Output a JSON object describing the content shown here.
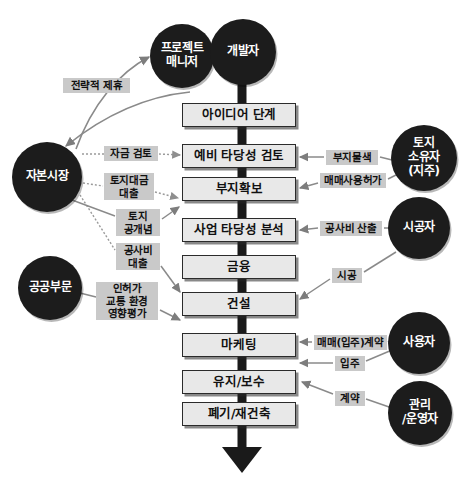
{
  "diagram": {
    "colors": {
      "box_fill": "#e8e8e8",
      "box_border": "#2b2b2b",
      "actor_fill": "#1c1c1c",
      "actor_text": "#ffffff",
      "tag_fill": "#c9c9c9",
      "spine": "#1a1a1a",
      "connector": "#8a8a8a",
      "background": "#ffffff"
    }
  },
  "process_steps": [
    {
      "id": "idea",
      "label": "아이디어 단계",
      "x": 182,
      "y": 103,
      "w": 114,
      "h": 24
    },
    {
      "id": "prefeas",
      "label": "예비 타당성 검토",
      "x": 182,
      "y": 144,
      "w": 114,
      "h": 24
    },
    {
      "id": "landsecure",
      "label": "부지확보",
      "x": 182,
      "y": 177,
      "w": 114,
      "h": 24
    },
    {
      "id": "feasibility",
      "label": "사업 타당성 분석",
      "x": 182,
      "y": 218,
      "w": 114,
      "h": 24
    },
    {
      "id": "finance",
      "label": "금융",
      "x": 182,
      "y": 255,
      "w": 114,
      "h": 24
    },
    {
      "id": "construct",
      "label": "건설",
      "x": 182,
      "y": 292,
      "w": 114,
      "h": 24
    },
    {
      "id": "marketing",
      "label": "마케팅",
      "x": 182,
      "y": 333,
      "w": 114,
      "h": 24
    },
    {
      "id": "maintenance",
      "label": "유지/보수",
      "x": 182,
      "y": 370,
      "w": 114,
      "h": 24
    },
    {
      "id": "demolish",
      "label": "폐기/재건축",
      "x": 182,
      "y": 402,
      "w": 114,
      "h": 24
    }
  ],
  "actors": [
    {
      "id": "project-manager",
      "label": "프로젝트\n매니저",
      "cx": 182,
      "cy": 56,
      "r": 32
    },
    {
      "id": "developer",
      "label": "개발자",
      "cx": 243,
      "cy": 52,
      "r": 33
    },
    {
      "id": "capital-market",
      "label": "자본시장",
      "cx": 47,
      "cy": 177,
      "r": 35
    },
    {
      "id": "public-sector",
      "label": "공공부문",
      "cx": 50,
      "cy": 288,
      "r": 32
    },
    {
      "id": "landowner",
      "label": "토지\n소유자\n(지주)",
      "cx": 424,
      "cy": 158,
      "r": 33
    },
    {
      "id": "contractor",
      "label": "시공자",
      "cx": 419,
      "cy": 228,
      "r": 31
    },
    {
      "id": "end-user",
      "label": "사용자",
      "cx": 419,
      "cy": 343,
      "r": 31
    },
    {
      "id": "operator",
      "label": "관리\n/운영자",
      "cx": 420,
      "cy": 413,
      "r": 32
    }
  ],
  "tags": [
    {
      "id": "strategic-alliance",
      "label": "전략적 제휴",
      "x": 63,
      "y": 78,
      "w": 67,
      "h": 15
    },
    {
      "id": "fund-review",
      "label": "자금 검토",
      "x": 104,
      "y": 146,
      "w": 54,
      "h": 15
    },
    {
      "id": "land-payment-loan",
      "label": "토지대금\n대출",
      "x": 104,
      "y": 173,
      "w": 50,
      "h": 27
    },
    {
      "id": "land-public-concept",
      "label": "토지\n공개념",
      "x": 116,
      "y": 209,
      "w": 44,
      "h": 27
    },
    {
      "id": "construction-loan",
      "label": "공사비\n대출",
      "x": 116,
      "y": 243,
      "w": 44,
      "h": 27
    },
    {
      "id": "permit-impact",
      "label": "인허가\n교통 환경\n영향평가",
      "x": 96,
      "y": 282,
      "w": 62,
      "h": 38
    },
    {
      "id": "site-search",
      "label": "부지물색",
      "x": 326,
      "y": 150,
      "w": 52,
      "h": 15
    },
    {
      "id": "sale-use-permit",
      "label": "매매사용허가",
      "x": 320,
      "y": 173,
      "w": 66,
      "h": 15
    },
    {
      "id": "cost-estimate",
      "label": "공사비 산출",
      "x": 320,
      "y": 221,
      "w": 62,
      "h": 15
    },
    {
      "id": "construction-work",
      "label": "시공",
      "x": 332,
      "y": 268,
      "w": 30,
      "h": 15
    },
    {
      "id": "purchase-contract",
      "label": "매매(입주)계약",
      "x": 314,
      "y": 335,
      "w": 73,
      "h": 15
    },
    {
      "id": "move-in",
      "label": "입주",
      "x": 335,
      "y": 356,
      "w": 30,
      "h": 15
    },
    {
      "id": "contract",
      "label": "계약",
      "x": 335,
      "y": 391,
      "w": 30,
      "h": 15
    }
  ],
  "flow_arrow": {
    "id": "process-flow-arrow",
    "description": "아래 방향 진행 화살표"
  }
}
